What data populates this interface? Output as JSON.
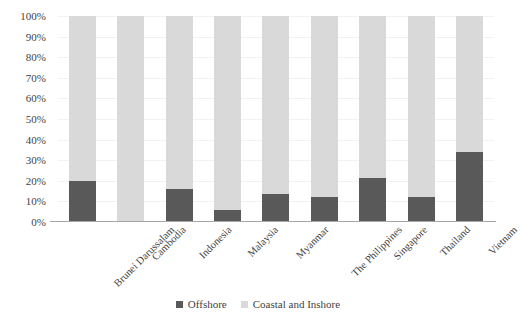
{
  "chart_data": {
    "type": "bar",
    "subtype": "stacked-percent",
    "title": "",
    "xlabel": "",
    "ylabel": "",
    "ylim": [
      0,
      100
    ],
    "grid": true,
    "legend_position": "bottom",
    "categories": [
      "Brunei Darussalam",
      "Cambodia",
      "Indonesia",
      "Malaysia",
      "Myanmar",
      "The Philippines",
      "Singapore",
      "Thailand",
      "Vietnam"
    ],
    "y_ticks": [
      "0%",
      "10%",
      "20%",
      "30%",
      "40%",
      "50%",
      "60%",
      "70%",
      "80%",
      "90%",
      "100%"
    ],
    "y_tick_values": [
      0,
      10,
      20,
      30,
      40,
      50,
      60,
      70,
      80,
      90,
      100
    ],
    "series": [
      {
        "name": "Offshore",
        "color": "#595959",
        "values": [
          20,
          0,
          16,
          6,
          13.5,
          12,
          21.5,
          12,
          34
        ]
      },
      {
        "name": "Coastal and Inshore",
        "color": "#d9d9d9",
        "values": [
          80,
          100,
          84,
          94,
          86.5,
          88,
          78.5,
          88,
          66
        ]
      }
    ]
  },
  "legend": {
    "items": [
      {
        "label": "Offshore",
        "color": "#595959"
      },
      {
        "label": "Coastal and Inshore",
        "color": "#d9d9d9"
      }
    ]
  },
  "colors": {
    "offshore": "#595959",
    "coastal": "#d9d9d9",
    "gridline": "#f2f2f2",
    "axis": "#a6a6a6",
    "text": "#3f3f3f",
    "background": "#ffffff"
  }
}
